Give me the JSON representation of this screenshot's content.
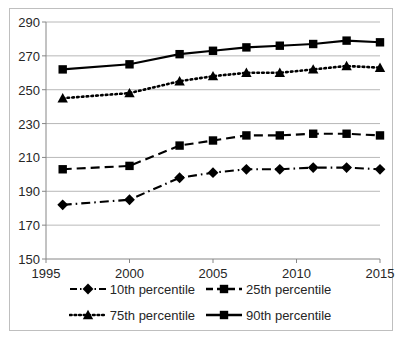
{
  "chart_data": {
    "type": "line",
    "title": "",
    "xlabel": "",
    "ylabel": "",
    "xlim": [
      1995,
      2015
    ],
    "ylim": [
      150,
      290
    ],
    "ytick_step": 20,
    "xtick_step": 5,
    "yticks": [
      150,
      170,
      190,
      210,
      230,
      250,
      270,
      290
    ],
    "xticks": [
      1995,
      2000,
      2005,
      2010,
      2015
    ],
    "grid": "horizontal",
    "legend_position": "bottom",
    "x": [
      1996,
      2000,
      2003,
      2005,
      2007,
      2009,
      2011,
      2013,
      2015
    ],
    "series": [
      {
        "name": "10th percentile",
        "values": [
          182,
          185,
          198,
          201,
          203,
          203,
          204,
          204,
          203
        ],
        "marker": "diamond",
        "line_style": "dash-dot",
        "color": "#000000"
      },
      {
        "name": "25th percentile",
        "values": [
          203,
          205,
          217,
          220,
          223,
          223,
          224,
          224,
          223
        ],
        "marker": "square",
        "line_style": "dashed",
        "color": "#000000"
      },
      {
        "name": "75th percentile",
        "values": [
          245,
          248,
          255,
          258,
          260,
          260,
          262,
          264,
          263
        ],
        "marker": "triangle",
        "line_style": "dotted",
        "color": "#000000"
      },
      {
        "name": "90th percentile",
        "values": [
          262,
          265,
          271,
          273,
          275,
          276,
          277,
          279,
          278
        ],
        "marker": "square",
        "line_style": "solid",
        "color": "#000000"
      }
    ]
  },
  "axis": {
    "y_tick_labels": [
      "290",
      "270",
      "250",
      "230",
      "210",
      "190",
      "170",
      "150"
    ],
    "x_tick_labels": [
      "1995",
      "2000",
      "2005",
      "2010",
      "2015"
    ]
  },
  "legend": {
    "rows": [
      [
        {
          "label": "10th percentile",
          "key": "dashdot-diamond"
        },
        {
          "label": "25th percentile",
          "key": "dashed-square"
        }
      ],
      [
        {
          "label": "75th percentile",
          "key": "dotted-triangle"
        },
        {
          "label": "90th percentile",
          "key": "solid-square"
        }
      ]
    ]
  },
  "style": {
    "grid_color": "#a6a6a6",
    "axis_color": "#868686",
    "text_color": "#262626",
    "frame_color": "#bfbfbf",
    "series_color": "#000000"
  }
}
